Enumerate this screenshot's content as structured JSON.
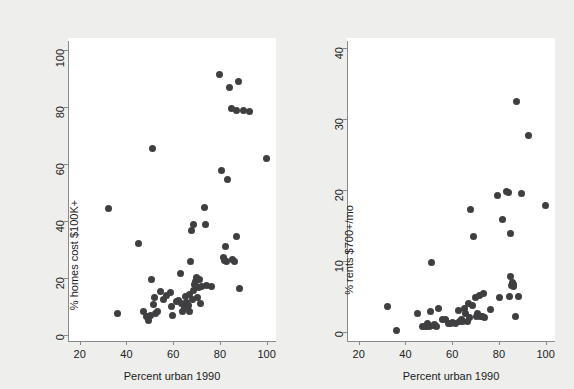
{
  "figure": {
    "background_color": "#eeeeec",
    "plot_background_color": "#ffffff",
    "marker_color": "#3f3f41",
    "axis_color": "#8a8a88"
  },
  "chart_data": [
    {
      "type": "scatter",
      "panel": "left",
      "title": "",
      "xlabel": "Percent urban 1990",
      "ylabel": "% homes cost $100K+",
      "xlim": [
        15,
        104
      ],
      "ylim": [
        -2,
        103
      ],
      "xticks": [
        20,
        40,
        60,
        80,
        100
      ],
      "yticks": [
        0,
        20,
        40,
        60,
        80,
        100
      ],
      "grid": false,
      "legend": "none",
      "points": [
        [
          32.3,
          44.3
        ],
        [
          36.2,
          7.5
        ],
        [
          45.0,
          32.0
        ],
        [
          47.3,
          8.2
        ],
        [
          48.6,
          6.6
        ],
        [
          49.3,
          5.3
        ],
        [
          50.3,
          7.1
        ],
        [
          50.8,
          19.4
        ],
        [
          51.2,
          65.3
        ],
        [
          51.6,
          10.8
        ],
        [
          52.0,
          13.1
        ],
        [
          52.6,
          7.8
        ],
        [
          53.4,
          8.3
        ],
        [
          54.6,
          15.4
        ],
        [
          55.9,
          12.6
        ],
        [
          57.2,
          13.8
        ],
        [
          58.7,
          14.9
        ],
        [
          59.1,
          10.2
        ],
        [
          59.6,
          7.1
        ],
        [
          61.3,
          11.8
        ],
        [
          62.4,
          12.2
        ],
        [
          63.1,
          21.8
        ],
        [
          63.6,
          11.3
        ],
        [
          64.2,
          8.4
        ],
        [
          64.8,
          9.7
        ],
        [
          65.3,
          13.6
        ],
        [
          65.8,
          11.5
        ],
        [
          66.4,
          10.3
        ],
        [
          66.8,
          14.4
        ],
        [
          67.1,
          8.3
        ],
        [
          67.5,
          25.7
        ],
        [
          67.9,
          36.8
        ],
        [
          68.2,
          12.4
        ],
        [
          68.6,
          15.8
        ],
        [
          68.9,
          38.9
        ],
        [
          69.3,
          17.9
        ],
        [
          69.7,
          19.0
        ],
        [
          70.1,
          20.4
        ],
        [
          70.4,
          13.2
        ],
        [
          70.8,
          16.6
        ],
        [
          71.2,
          19.6
        ],
        [
          71.7,
          11.1
        ],
        [
          72.3,
          17.2
        ],
        [
          73.2,
          44.6
        ],
        [
          73.8,
          38.8
        ],
        [
          74.1,
          17.3
        ],
        [
          76.4,
          17.2
        ],
        [
          79.8,
          91.2
        ],
        [
          80.6,
          57.6
        ],
        [
          81.4,
          27.1
        ],
        [
          81.9,
          26.3
        ],
        [
          82.2,
          31.2
        ],
        [
          82.8,
          25.9
        ],
        [
          83.2,
          54.5
        ],
        [
          84.3,
          86.9
        ],
        [
          85.1,
          79.3
        ],
        [
          85.6,
          26.4
        ],
        [
          86.3,
          25.7
        ],
        [
          86.9,
          34.7
        ],
        [
          87.3,
          78.6
        ],
        [
          87.8,
          88.8
        ],
        [
          88.4,
          16.3
        ],
        [
          90.2,
          78.6
        ],
        [
          92.6,
          78.4
        ],
        [
          100.0,
          61.8
        ]
      ]
    },
    {
      "type": "scatter",
      "panel": "right",
      "title": "",
      "xlabel": "Percent urban 1990",
      "ylabel": "% rents $700+/mo",
      "xlim": [
        15,
        104
      ],
      "ylim": [
        -1.2,
        41
      ],
      "xticks": [
        20,
        40,
        60,
        80,
        100
      ],
      "yticks": [
        0,
        10,
        20,
        30,
        40
      ],
      "grid": false,
      "legend": "none",
      "points": [
        [
          32.3,
          3.7
        ],
        [
          36.2,
          0.3
        ],
        [
          45.0,
          2.6
        ],
        [
          47.3,
          0.9
        ],
        [
          48.2,
          0.8
        ],
        [
          48.9,
          0.9
        ],
        [
          49.6,
          1.2
        ],
        [
          50.3,
          0.9
        ],
        [
          50.8,
          3.0
        ],
        [
          51.2,
          9.8
        ],
        [
          51.8,
          1.0
        ],
        [
          52.4,
          1.1
        ],
        [
          53.1,
          0.9
        ],
        [
          54.2,
          3.4
        ],
        [
          55.9,
          1.8
        ],
        [
          57.1,
          1.8
        ],
        [
          58.4,
          1.2
        ],
        [
          59.2,
          1.2
        ],
        [
          60.1,
          1.4
        ],
        [
          61.4,
          1.3
        ],
        [
          62.6,
          3.1
        ],
        [
          63.2,
          1.6
        ],
        [
          63.9,
          1.8
        ],
        [
          64.6,
          1.5
        ],
        [
          65.3,
          3.4
        ],
        [
          65.9,
          2.6
        ],
        [
          66.5,
          1.6
        ],
        [
          67.1,
          4.1
        ],
        [
          67.6,
          2.1
        ],
        [
          68.0,
          17.3
        ],
        [
          68.6,
          3.8
        ],
        [
          69.2,
          13.5
        ],
        [
          69.8,
          4.9
        ],
        [
          70.4,
          2.2
        ],
        [
          70.9,
          2.6
        ],
        [
          71.5,
          5.2
        ],
        [
          72.1,
          2.3
        ],
        [
          72.8,
          2.3
        ],
        [
          73.4,
          5.5
        ],
        [
          74.0,
          2.1
        ],
        [
          76.5,
          3.3
        ],
        [
          79.6,
          19.3
        ],
        [
          80.2,
          4.9
        ],
        [
          81.7,
          15.9
        ],
        [
          83.4,
          19.8
        ],
        [
          84.2,
          19.7
        ],
        [
          84.7,
          5.1
        ],
        [
          84.9,
          13.9
        ],
        [
          85.1,
          7.9
        ],
        [
          85.4,
          6.6
        ],
        [
          85.8,
          7.0
        ],
        [
          86.1,
          6.4
        ],
        [
          86.4,
          6.7
        ],
        [
          86.9,
          2.3
        ],
        [
          87.5,
          32.5
        ],
        [
          88.3,
          5.0
        ],
        [
          89.5,
          19.5
        ],
        [
          92.8,
          27.7
        ],
        [
          100.0,
          17.8
        ]
      ]
    }
  ]
}
